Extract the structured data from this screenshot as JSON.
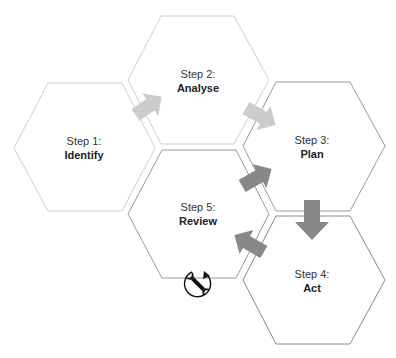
{
  "diagram": {
    "type": "hexagon-cycle",
    "colors": {
      "hex_stroke_light": "#c8c8c8",
      "hex_stroke_dark": "#8a8a8a",
      "arrow_light": "#cccccc",
      "arrow_dark": "#888888",
      "text": "#333333"
    },
    "steps": [
      {
        "id": "identify",
        "step": "Step 1:",
        "name": "Identify"
      },
      {
        "id": "analyse",
        "step": "Step 2:",
        "name": "Analyse"
      },
      {
        "id": "plan",
        "step": "Step 3:",
        "name": "Plan"
      },
      {
        "id": "act",
        "step": "Step 4:",
        "name": "Act"
      },
      {
        "id": "review",
        "step": "Step 5:",
        "name": "Review",
        "icon": "wrench-cycle-icon"
      }
    ],
    "arrows": [
      {
        "from": "Identify",
        "to": "Analyse",
        "shade": "light"
      },
      {
        "from": "Analyse",
        "to": "Plan",
        "shade": "light"
      },
      {
        "from": "Review",
        "to": "Plan",
        "shade": "dark"
      },
      {
        "from": "Plan",
        "to": "Act",
        "shade": "dark"
      },
      {
        "from": "Act",
        "to": "Review",
        "shade": "dark"
      }
    ]
  }
}
